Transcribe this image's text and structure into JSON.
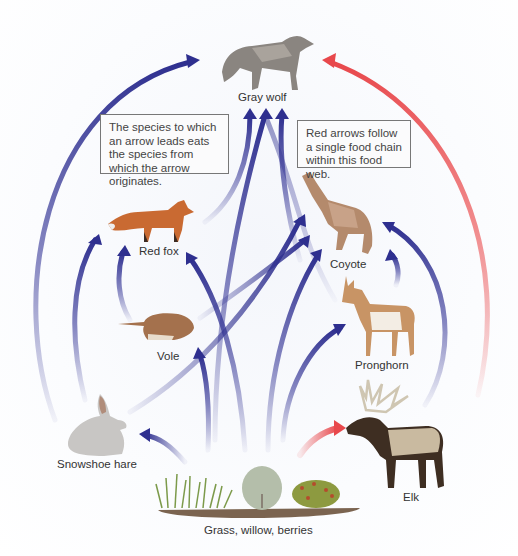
{
  "title": "Food web",
  "notes": {
    "left": "The species to which an arrow leads eats the species from which the arrow originates.",
    "right": "Red arrows follow a single food chain within this food web."
  },
  "organisms": {
    "gray_wolf": "Gray wolf",
    "red_fox": "Red fox",
    "coyote": "Coyote",
    "vole": "Vole",
    "pronghorn": "Pronghorn",
    "snowshoe_hare": "Snowshoe hare",
    "elk": "Elk",
    "plants": "Grass, willow, berries"
  },
  "colors": {
    "blue_arrow": "#2e2f8f",
    "red_arrow": "#e8484c",
    "background": "#ffffff"
  },
  "links": [
    {
      "from": "Snowshoe hare",
      "to": "Gray wolf",
      "color": "blue"
    },
    {
      "from": "Snowshoe hare",
      "to": "Red fox",
      "color": "blue"
    },
    {
      "from": "Snowshoe hare",
      "to": "Coyote",
      "color": "blue"
    },
    {
      "from": "Vole",
      "to": "Red fox",
      "color": "blue"
    },
    {
      "from": "Vole",
      "to": "Coyote",
      "color": "blue"
    },
    {
      "from": "Red fox",
      "to": "Gray wolf",
      "color": "blue"
    },
    {
      "from": "Coyote",
      "to": "Gray wolf",
      "color": "blue"
    },
    {
      "from": "Pronghorn",
      "to": "Coyote",
      "color": "blue"
    },
    {
      "from": "Pronghorn",
      "to": "Gray wolf",
      "color": "blue"
    },
    {
      "from": "Elk",
      "to": "Coyote",
      "color": "blue"
    },
    {
      "from": "Elk",
      "to": "Gray wolf",
      "color": "red"
    },
    {
      "from": "Grass, willow, berries",
      "to": "Snowshoe hare",
      "color": "blue"
    },
    {
      "from": "Grass, willow, berries",
      "to": "Vole",
      "color": "blue"
    },
    {
      "from": "Grass, willow, berries",
      "to": "Red fox",
      "color": "blue"
    },
    {
      "from": "Grass, willow, berries",
      "to": "Coyote",
      "color": "blue"
    },
    {
      "from": "Grass, willow, berries",
      "to": "Pronghorn",
      "color": "blue"
    },
    {
      "from": "Grass, willow, berries",
      "to": "Elk",
      "color": "red"
    }
  ]
}
